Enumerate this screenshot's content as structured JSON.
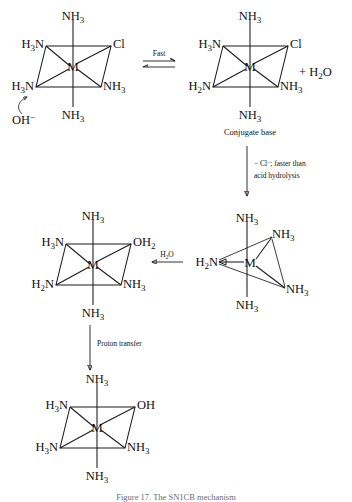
{
  "figure": {
    "title_caption": "Figure 17. The SN1CB mechanism",
    "domain_note": "base hydrolysis mechanism of an octahedral metal ammine complex"
  },
  "colors": {
    "ink": "#1a1a1a",
    "background": "#ffffff"
  },
  "structures": {
    "reactant": {
      "id": "reactant-octahedron",
      "metal": "M",
      "ligand_top": "NH",
      "ligand_top_sub": "3",
      "ligand_bottom": "NH",
      "ligand_bottom_sub": "3",
      "ligand_back_left": "H",
      "ligand_back_left_sub": "3",
      "ligand_back_left_tail": "N",
      "ligand_back_right": "Cl",
      "ligand_front_left": "H",
      "ligand_front_left_sub": "3",
      "ligand_front_left_tail": "N",
      "ligand_front_right": "NH",
      "ligand_front_right_sub": "3",
      "reagent": "OH",
      "reagent_charge": "−"
    },
    "conjugate_base": {
      "id": "conjugate-base-octahedron",
      "metal": "M",
      "ligand_top": "NH",
      "ligand_top_sub": "3",
      "ligand_bottom": "NH",
      "ligand_bottom_sub": "3",
      "ligand_back_left": "H",
      "ligand_back_left_sub": "3",
      "ligand_back_left_tail": "N",
      "ligand_back_right": "Cl",
      "ligand_front_left": "H",
      "ligand_front_left_sub": "2",
      "ligand_front_left_tail": "N",
      "ligand_front_right": "NH",
      "ligand_front_right_sub": "3",
      "caption": "Conjugate base",
      "byproduct": "+ H",
      "byproduct_sub": "2",
      "byproduct_tail": "O"
    },
    "five_coordinate": {
      "id": "five-coordinate-intermediate",
      "metal": "M",
      "ligand_top": "NH",
      "ligand_top_sub": "3",
      "ligand_bottom": "NH",
      "ligand_bottom_sub": "3",
      "ligand_upper_right": "NH",
      "ligand_upper_right_sub": "3",
      "ligand_lower_right": "NH",
      "ligand_lower_right_sub": "3",
      "ligand_left": "H",
      "ligand_left_sub": "2",
      "ligand_left_tail": "N"
    },
    "aqua_complex": {
      "id": "aqua-complex-octahedron",
      "metal": "M",
      "ligand_top": "NH",
      "ligand_top_sub": "3",
      "ligand_bottom": "NH",
      "ligand_bottom_sub": "3",
      "ligand_back_left": "H",
      "ligand_back_left_sub": "3",
      "ligand_back_left_tail": "N",
      "ligand_back_right": "OH",
      "ligand_back_right_sub": "2",
      "ligand_front_left": "H",
      "ligand_front_left_sub": "2",
      "ligand_front_left_tail": "N",
      "ligand_front_right": "NH",
      "ligand_front_right_sub": "3"
    },
    "product": {
      "id": "hydroxo-product-octahedron",
      "metal": "M",
      "ligand_top": "NH",
      "ligand_top_sub": "3",
      "ligand_bottom": "NH",
      "ligand_bottom_sub": "3",
      "ligand_back_left": "H",
      "ligand_back_left_sub": "3",
      "ligand_back_left_tail": "N",
      "ligand_back_right": "OH",
      "ligand_front_left": "H",
      "ligand_front_left_sub": "3",
      "ligand_front_left_tail": "N",
      "ligand_front_right": "NH",
      "ligand_front_right_sub": "3"
    }
  },
  "arrows": {
    "equilibrium": {
      "id": "equilibrium-arrow",
      "label": "Fast"
    },
    "chloride_loss": {
      "id": "chloride-loss-arrow",
      "label_line1": "− Cl",
      "label_line1_sup": "−",
      "label_line1_tail": "; faster than",
      "label_line2": "acid hydrolysis"
    },
    "water_attack": {
      "id": "water-attack-arrow",
      "label": "H",
      "label_sub": "2",
      "label_tail": "O"
    },
    "proton_transfer": {
      "id": "proton-transfer-arrow",
      "label": "Proton transfer"
    }
  }
}
